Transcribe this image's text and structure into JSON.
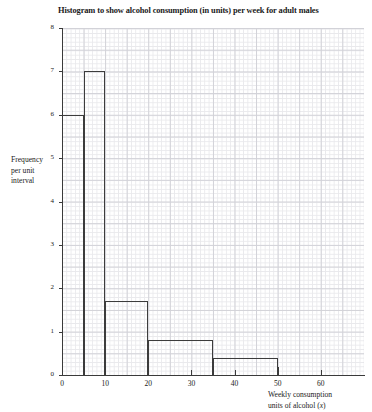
{
  "chart_data": {
    "type": "bar",
    "title": "Histogram to show alcohol consumption (in units) per week for adult males",
    "xlabel": "Weekly consumption units of alcohol (x)",
    "ylabel": "Frequency per unit interval",
    "xlim": [
      0,
      70
    ],
    "ylim": [
      0,
      8
    ],
    "grid": true,
    "legend": "none",
    "x_tick_labels": [
      "0",
      "10",
      "20",
      "30",
      "40",
      "50",
      "60"
    ],
    "x_tick_values": [
      0,
      10,
      20,
      30,
      40,
      50,
      60
    ],
    "y_tick_labels": [
      "0",
      "1",
      "2",
      "3",
      "4",
      "5",
      "6",
      "7",
      "8"
    ],
    "y_tick_values": [
      0,
      1,
      2,
      3,
      4,
      5,
      6,
      7,
      8
    ],
    "bin_edges": [
      0,
      5,
      10,
      20,
      35,
      50
    ],
    "bars": [
      {
        "x_start": 0,
        "x_end": 5,
        "height": 6.0
      },
      {
        "x_start": 5,
        "x_end": 10,
        "height": 7.0
      },
      {
        "x_start": 10,
        "x_end": 20,
        "height": 1.7
      },
      {
        "x_start": 20,
        "x_end": 35,
        "height": 0.8
      },
      {
        "x_start": 35,
        "x_end": 50,
        "height": 0.4
      }
    ],
    "values": [
      6.0,
      7.0,
      1.7,
      0.8,
      0.4
    ],
    "categories": [
      "0-5",
      "5-10",
      "10-20",
      "20-35",
      "35-50"
    ]
  },
  "labels": {
    "y_title_line1": "Frequency",
    "y_title_line2": "per unit",
    "y_title_line3": "interval",
    "x_title_line1": "Weekly consumption",
    "x_title_line2_pre": "units of alcohol (",
    "x_title_line2_var": "x",
    "x_title_line2_post": ")"
  },
  "colors": {
    "bar_outline": "#3c3c3c",
    "axis": "#3a3a3a",
    "grid_fine": "#e9e9ec",
    "grid_major": "#d2d2d8",
    "background": "#ffffff",
    "text": "#1a1a1a"
  }
}
